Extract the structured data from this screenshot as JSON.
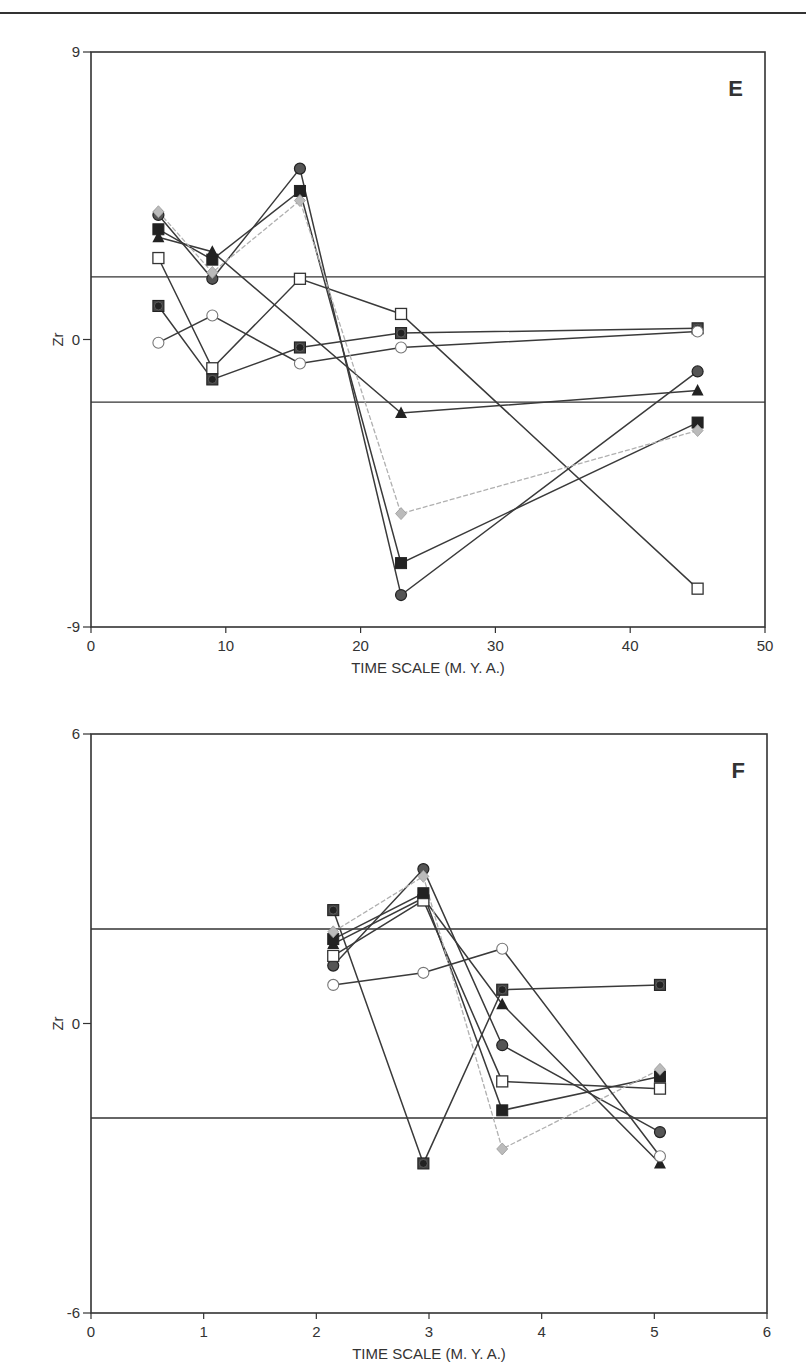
{
  "page": {
    "header_rule": true
  },
  "chart_data": [
    {
      "type": "line",
      "panel_label": "E",
      "title": "",
      "xlabel": "TIME SCALE (M. Y. A.)",
      "ylabel": "Zr",
      "xlim": [
        0,
        50
      ],
      "ylim": [
        -9,
        9
      ],
      "xticks": [
        "0",
        "10",
        "20",
        "30",
        "40",
        "50"
      ],
      "yticks": [
        "9",
        "0",
        "-9"
      ],
      "reference_lines": [
        1.96,
        -1.96
      ],
      "grid": false,
      "legend": null,
      "x": [
        5,
        9,
        15.5,
        23,
        45
      ],
      "series": [
        {
          "name": "open-square",
          "marker": "square-open",
          "color": "#333333",
          "points": [
            [
              5,
              2.55
            ],
            [
              9,
              -0.9
            ],
            [
              15.5,
              1.9
            ],
            [
              23,
              0.8
            ],
            [
              45,
              -7.8
            ]
          ]
        },
        {
          "name": "filled-square",
          "marker": "square-filled",
          "color": "#222222",
          "points": [
            [
              5,
              3.45
            ],
            [
              9,
              2.5
            ],
            [
              15.5,
              4.65
            ],
            [
              23,
              -7.0
            ],
            [
              45,
              -2.6
            ]
          ]
        },
        {
          "name": "filled-circle",
          "marker": "circle-filled",
          "color": "#555555",
          "points": [
            [
              5,
              3.9
            ],
            [
              9,
              1.9
            ],
            [
              15.5,
              5.35
            ],
            [
              23,
              -8.0
            ],
            [
              45,
              -1.0
            ]
          ]
        },
        {
          "name": "filled-triangle",
          "marker": "triangle-filled",
          "color": "#222222",
          "points": [
            [
              5,
              3.2
            ],
            [
              9,
              2.75
            ],
            [
              23,
              -2.3
            ],
            [
              45,
              -1.6
            ]
          ]
        },
        {
          "name": "square-with-circle",
          "marker": "square-circle",
          "color": "#333333",
          "points": [
            [
              5,
              1.05
            ],
            [
              9,
              -1.25
            ],
            [
              15.5,
              -0.25
            ],
            [
              23,
              0.2
            ],
            [
              45,
              0.35
            ]
          ]
        },
        {
          "name": "open-circle",
          "marker": "circle-open",
          "color": "#666666",
          "points": [
            [
              5,
              -0.1
            ],
            [
              9,
              0.75
            ],
            [
              15.5,
              -0.75
            ],
            [
              23,
              -0.25
            ],
            [
              45,
              0.25
            ]
          ]
        },
        {
          "name": "gray-diamond",
          "marker": "diamond-gray",
          "color": "#aaaaaa",
          "points": [
            [
              5,
              4.0
            ],
            [
              9,
              2.1
            ],
            [
              15.5,
              4.35
            ],
            [
              23,
              -5.45
            ],
            [
              45,
              -2.85
            ]
          ]
        }
      ]
    },
    {
      "type": "line",
      "panel_label": "F",
      "title": "",
      "xlabel": "TIME SCALE (M. Y. A.)",
      "ylabel": "Zr",
      "xlim": [
        0,
        6
      ],
      "ylim": [
        -6,
        6
      ],
      "xticks": [
        "0",
        "1",
        "2",
        "3",
        "4",
        "5",
        "6"
      ],
      "yticks": [
        "6",
        "0",
        "-6"
      ],
      "reference_lines": [
        1.96,
        -1.96
      ],
      "grid": false,
      "legend": null,
      "x": [
        2.15,
        2.95,
        3.65,
        5.05
      ],
      "series": [
        {
          "name": "square-with-circle",
          "marker": "square-circle",
          "color": "#333333",
          "points": [
            [
              2.15,
              2.35
            ],
            [
              2.95,
              -2.9
            ],
            [
              3.65,
              0.7
            ],
            [
              5.05,
              0.8
            ]
          ]
        },
        {
          "name": "filled-circle",
          "marker": "circle-filled",
          "color": "#555555",
          "points": [
            [
              2.15,
              1.2
            ],
            [
              2.95,
              3.2
            ],
            [
              3.65,
              -0.45
            ],
            [
              5.05,
              -2.25
            ]
          ]
        },
        {
          "name": "filled-triangle",
          "marker": "triangle-filled",
          "color": "#222222",
          "points": [
            [
              2.15,
              1.65
            ],
            [
              2.95,
              2.6
            ],
            [
              3.65,
              0.4
            ],
            [
              5.05,
              -2.9
            ]
          ]
        },
        {
          "name": "open-square",
          "marker": "square-open",
          "color": "#333333",
          "points": [
            [
              2.15,
              1.4
            ],
            [
              2.95,
              2.55
            ],
            [
              3.65,
              -1.2
            ],
            [
              5.05,
              -1.35
            ]
          ]
        },
        {
          "name": "filled-square",
          "marker": "square-filled",
          "color": "#222222",
          "points": [
            [
              2.15,
              1.75
            ],
            [
              2.95,
              2.7
            ],
            [
              3.65,
              -1.8
            ],
            [
              5.05,
              -1.1
            ]
          ]
        },
        {
          "name": "gray-diamond",
          "marker": "diamond-gray",
          "color": "#aaaaaa",
          "points": [
            [
              2.15,
              1.9
            ],
            [
              2.95,
              3.05
            ],
            [
              3.65,
              -2.6
            ],
            [
              5.05,
              -0.95
            ]
          ]
        },
        {
          "name": "open-circle",
          "marker": "circle-open",
          "color": "#666666",
          "points": [
            [
              2.15,
              0.8
            ],
            [
              2.95,
              1.05
            ],
            [
              3.65,
              1.55
            ],
            [
              5.05,
              -2.75
            ]
          ]
        }
      ]
    }
  ]
}
